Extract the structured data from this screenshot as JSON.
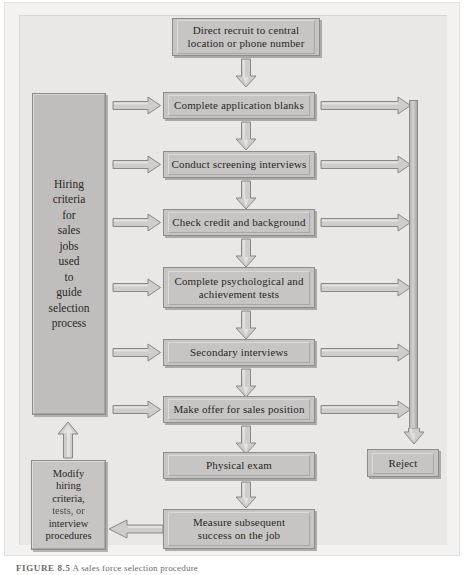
{
  "figure": {
    "caption_label": "FIGURE 8.5",
    "caption_text": "A sales force selection procedure"
  },
  "colors": {
    "box_fill": "#c7c5c3",
    "box_border": "#8e8c8a",
    "panel_bg": "#e9e8e7",
    "frame_bg": "#f3f2f1",
    "arrow_fill": "#cfcdcb",
    "arrow_border": "#8a8886",
    "text": "#2a2724"
  },
  "sidebar": {
    "hiring_criteria": {
      "name": "Hiring criteria for sales jobs used to guide selection process",
      "lines": [
        "Hiring",
        "criteria",
        "for",
        "sales",
        "jobs",
        "used",
        "to",
        "guide",
        "selection",
        "process"
      ]
    },
    "modify": {
      "name": "Modify hiring criteria, tests, or interview procedures",
      "lines": [
        "Modify",
        "hiring",
        "criteria,",
        "tests, or",
        "interview",
        "procedures"
      ],
      "blurred_line_index": 3
    }
  },
  "flow": {
    "entry": {
      "line1": "Direct recruit to central",
      "line2": "location or phone number"
    },
    "steps": [
      {
        "id": "application-blanks",
        "line1": "Complete application blanks",
        "line2": "",
        "rejects": true
      },
      {
        "id": "screening-interviews",
        "line1": "Conduct screening interviews",
        "line2": "",
        "rejects": true
      },
      {
        "id": "credit-background",
        "line1": "Check credit and background",
        "line2": "",
        "rejects": true
      },
      {
        "id": "psychological-tests",
        "line1": "Complete psychological and",
        "line2": "achievement tests",
        "rejects": true
      },
      {
        "id": "secondary-interviews",
        "line1": "Secondary interviews",
        "line2": "",
        "rejects": true
      },
      {
        "id": "make-offer",
        "line1": "Make offer for sales position",
        "line2": "",
        "rejects": true
      }
    ],
    "physical_exam": {
      "line1": "Physical exam",
      "line2": ""
    },
    "measure_success": {
      "line1": "Measure subsequent",
      "line2": "success on the job"
    },
    "reject": {
      "label": "Reject"
    }
  },
  "arrows": {
    "criteria_to_step": "criteria-feeds-step-arrow",
    "step_to_reject": "step-to-reject-arrow",
    "step_to_step": "step-to-next-step-arrow",
    "measure_to_modify": "feedback-to-modify-arrow",
    "modify_to_criteria": "modify-to-criteria-arrow",
    "rail_to_reject": "rail-to-reject-arrow"
  }
}
